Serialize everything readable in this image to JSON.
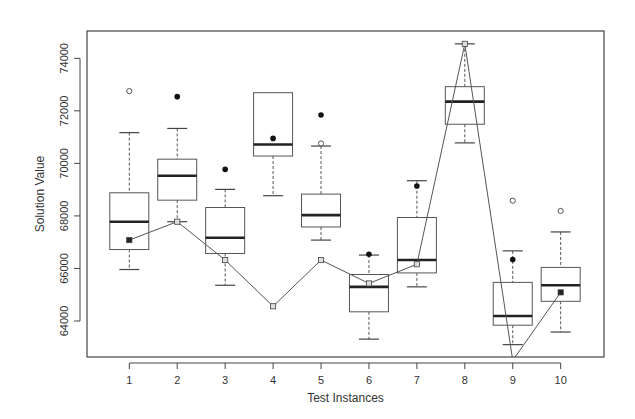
{
  "chart_data": {
    "type": "box",
    "title": "",
    "xlabel": "Test Instances",
    "ylabel": "Solution Value",
    "categories": [
      "1",
      "2",
      "3",
      "4",
      "5",
      "6",
      "7",
      "8",
      "9",
      "10"
    ],
    "ylim": [
      62600,
      74900
    ],
    "yticks": [
      64000,
      66000,
      68000,
      70000,
      72000,
      74000
    ],
    "ytick_labels": [
      "64000",
      "66000",
      "68000",
      "70000",
      "72000",
      "74000"
    ],
    "grid": false,
    "legend": null,
    "boxes": [
      {
        "category": "1",
        "whisker_low": 65960,
        "q1": 66720,
        "median": 67780,
        "q3": 68880,
        "whisker_high": 71170,
        "outliers_open": [
          72750
        ],
        "outliers_filled": []
      },
      {
        "category": "2",
        "whisker_low": 67780,
        "q1": 68600,
        "median": 69530,
        "q3": 70160,
        "whisker_high": 71330,
        "outliers_open": [],
        "outliers_filled": [
          72540
        ]
      },
      {
        "category": "3",
        "whisker_low": 65360,
        "q1": 66570,
        "median": 67170,
        "q3": 68320,
        "whisker_high": 69010,
        "outliers_open": [],
        "outliers_filled": [
          69770
        ]
      },
      {
        "category": "4",
        "whisker_low": 68770,
        "q1": 70280,
        "median": 70720,
        "q3": 72690,
        "whisker_high": 72690,
        "outliers_open": [],
        "outliers_filled": [
          70950
        ]
      },
      {
        "category": "5",
        "whisker_low": 67080,
        "q1": 67580,
        "median": 68030,
        "q3": 68830,
        "whisker_high": 70660,
        "outliers_open": [
          70760
        ],
        "outliers_filled": [
          71840
        ]
      },
      {
        "category": "6",
        "whisker_low": 63310,
        "q1": 64350,
        "median": 65300,
        "q3": 65770,
        "whisker_high": 66510,
        "outliers_open": [],
        "outliers_filled": [
          66540
        ]
      },
      {
        "category": "7",
        "whisker_low": 65300,
        "q1": 65830,
        "median": 66320,
        "q3": 67940,
        "whisker_high": 69340,
        "outliers_open": [],
        "outliers_filled": [
          69140
        ]
      },
      {
        "category": "8",
        "whisker_low": 70780,
        "q1": 71490,
        "median": 72350,
        "q3": 72920,
        "whisker_high": 74550,
        "outliers_open": [],
        "outliers_filled": []
      },
      {
        "category": "9",
        "whisker_low": 63100,
        "q1": 63840,
        "median": 64190,
        "q3": 65470,
        "whisker_high": 66670,
        "outliers_open": [
          68580
        ],
        "outliers_filled": [
          66340
        ]
      },
      {
        "category": "10",
        "whisker_low": 63580,
        "q1": 64750,
        "median": 65360,
        "q3": 66040,
        "whisker_high": 67390,
        "outliers_open": [
          68190
        ],
        "outliers_filled": []
      }
    ],
    "series": [
      {
        "name": "line",
        "type": "line",
        "values": [
          67080,
          67780,
          66320,
          64560,
          66320,
          65430,
          66160,
          74550,
          62500,
          65090
        ],
        "note": "point 9 falls below the visible y-range and is clipped at the axis"
      }
    ]
  }
}
